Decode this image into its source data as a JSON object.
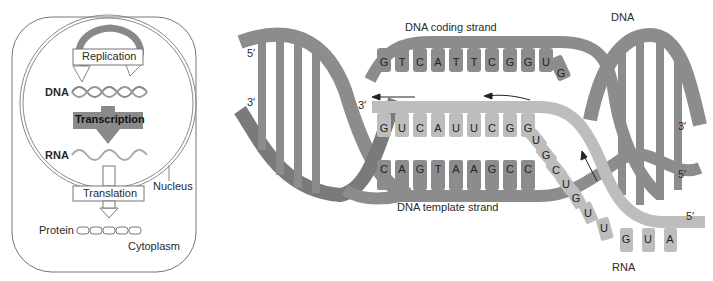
{
  "overview_panel": {
    "replication_label": "Replication",
    "dna_label": "DNA",
    "transcription_label": "Transcription",
    "rna_label": "RNA",
    "nucleus_label": "Nucleus",
    "translation_label": "Translation",
    "protein_label": "Protein",
    "cytoplasm_label": "Cytoplasm"
  },
  "detail_panel": {
    "dna_label": "DNA",
    "coding_strand_label": "DNA coding strand",
    "template_strand_label": "DNA template strand",
    "rna_label": "RNA",
    "end_labels": {
      "left_top": "5′",
      "left_bottom": "3′",
      "rna_3prime": "3′",
      "right_top": "3′",
      "right_bottom": "5′",
      "rna_5prime": "5′"
    },
    "coding_strand_bases": [
      "G",
      "T",
      "C",
      "A",
      "T",
      "T",
      "C",
      "G",
      "G",
      "U",
      "G"
    ],
    "rna_paired_bases": [
      "G",
      "U",
      "C",
      "A",
      "U",
      "U",
      "C",
      "G",
      "G"
    ],
    "template_strand_bases": [
      "C",
      "A",
      "G",
      "T",
      "A",
      "A",
      "G",
      "C",
      "C"
    ],
    "rna_tail_bases": [
      "U",
      "G",
      "C",
      "U",
      "G",
      "U",
      "U",
      "G",
      "U",
      "A"
    ]
  },
  "colors": {
    "dna_strand": "#8c8c8c",
    "dna_strand_dark": "#7a7a7a",
    "rna_strand": "#bdbdbd",
    "transcription_box": "#8a8a8a",
    "outline": "#666666"
  }
}
